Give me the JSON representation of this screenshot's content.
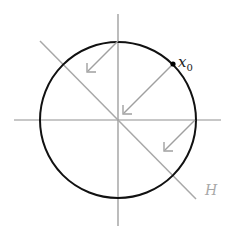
{
  "figure": {
    "labels": {
      "point": "x",
      "point_subscript": "0",
      "hyperplane": "H"
    },
    "colors": {
      "circle": "#111111",
      "axes": "#909090",
      "hyperplane": "#a8a8a8",
      "arrows": "#a0a0a0",
      "point": "#000000"
    },
    "geometry": {
      "center": [
        118,
        120
      ],
      "radius": 78
    },
    "arrows": [
      {
        "from": [
          118,
          41
        ],
        "to": [
          88,
          71
        ]
      },
      {
        "from": [
          172,
          65
        ],
        "to": [
          124,
          113
        ]
      },
      {
        "from": [
          195,
          120
        ],
        "to": [
          165,
          150
        ]
      }
    ]
  }
}
